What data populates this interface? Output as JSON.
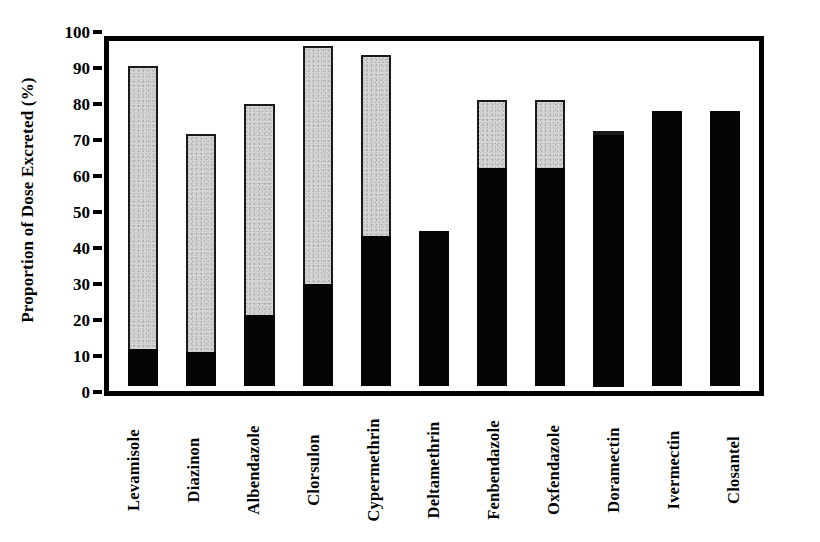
{
  "chart_data": {
    "type": "bar",
    "subtype": "stacked-bar",
    "title": "",
    "xlabel": "",
    "ylabel": "Proportion of Dose Excreted (%)",
    "ylim": [
      0,
      100
    ],
    "yticks": [
      0,
      10,
      20,
      30,
      40,
      50,
      60,
      70,
      80,
      90,
      100
    ],
    "ytick_labels": [
      "0",
      "10",
      "20",
      "30",
      "40",
      "50",
      "60",
      "70",
      "80",
      "90",
      "100"
    ],
    "grid": false,
    "legend": "none",
    "categories": [
      "Levamisole",
      "Diazinon",
      "Albendazole",
      "Clorsulon",
      "Cypermethrin",
      "Deltamethrin",
      "Fenbendazole",
      "Oxfendazole",
      "Doramectin",
      "Ivermectin",
      "Closantel"
    ],
    "series": [
      {
        "name": "black-segment",
        "color": "#050505",
        "values": [
          11,
          10,
          21,
          30,
          44,
          45.5,
          64,
          64,
          74,
          81,
          81
        ]
      },
      {
        "name": "gray-segment",
        "color": "#d4d4d4",
        "values": [
          83,
          64,
          62,
          70,
          53.5,
          0,
          20,
          20,
          1,
          0,
          0
        ]
      }
    ],
    "totals": [
      94,
      74,
      83,
      100,
      97.5,
      45.5,
      84,
      84,
      75,
      81,
      81
    ]
  },
  "axes": {
    "y_title": "Proportion of Dose Excreted (%)",
    "y_ticks": [
      {
        "label": "100",
        "value": 100
      },
      {
        "label": "90",
        "value": 90
      },
      {
        "label": "80",
        "value": 80
      },
      {
        "label": "70",
        "value": 70
      },
      {
        "label": "60",
        "value": 60
      },
      {
        "label": "50",
        "value": 50
      },
      {
        "label": "40",
        "value": 40
      },
      {
        "label": "30",
        "value": 30
      },
      {
        "label": "20",
        "value": 20
      },
      {
        "label": "10",
        "value": 10
      },
      {
        "label": "0",
        "value": 0
      }
    ]
  },
  "colors": {
    "bar_black": "#050505",
    "bar_gray": "#d4d4d4",
    "axis": "#000000",
    "background": "#ffffff"
  }
}
